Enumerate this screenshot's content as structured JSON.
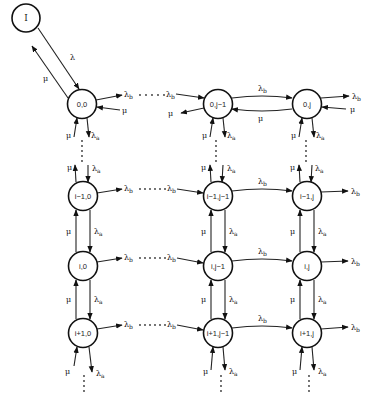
{
  "diagram": {
    "nodes": [
      {
        "id": "I",
        "label": "I",
        "x": 26,
        "y": 18
      },
      {
        "id": "0,0",
        "label": "0,0",
        "x": 82,
        "y": 104
      },
      {
        "id": "0,j-1",
        "label": "0,j−1",
        "x": 218,
        "y": 104
      },
      {
        "id": "0,j",
        "label": "0,j",
        "x": 307,
        "y": 104
      },
      {
        "id": "i-1,0",
        "label": "i−1,0",
        "x": 83,
        "y": 196
      },
      {
        "id": "i-1,j-1",
        "label": "i−1,j−1",
        "x": 218,
        "y": 196
      },
      {
        "id": "i-1,j",
        "label": "i−1,j",
        "x": 307,
        "y": 196
      },
      {
        "id": "i,0",
        "label": "i,0",
        "x": 83,
        "y": 266
      },
      {
        "id": "i,j-1",
        "label": "i,j−1",
        "x": 218,
        "y": 266
      },
      {
        "id": "i,j",
        "label": "i,j",
        "x": 307,
        "y": 266
      },
      {
        "id": "i+1,0",
        "label": "i+1,0",
        "x": 83,
        "y": 333
      },
      {
        "id": "i+1,j-1",
        "label": "i+1,j−1",
        "x": 218,
        "y": 333
      },
      {
        "id": "i+1,j",
        "label": "i+1,j",
        "x": 307,
        "y": 333
      }
    ],
    "rates": {
      "lambda": "λ",
      "lambda_a": "λa",
      "lambda_b": "λb",
      "mu": "μ"
    },
    "labels": {
      "lambda_symbol": "λ",
      "mu_symbol": "μ",
      "sub_a": "a",
      "sub_b": "b"
    },
    "ellipsis_vertical": "⋮",
    "colors": {
      "stroke": "#111111",
      "text": "#222222",
      "background": "#ffffff"
    }
  }
}
